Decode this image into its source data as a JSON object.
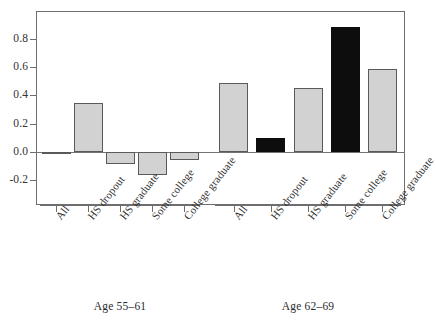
{
  "chart_data": {
    "type": "bar",
    "title": "",
    "subtitle": "",
    "xlabel": "",
    "ylabel": "",
    "ylim": [
      -0.3,
      0.98
    ],
    "grid": false,
    "legend": "none",
    "yticks": [
      {
        "value": 0.8,
        "label": "0.8"
      },
      {
        "value": 0.6,
        "label": "0.6"
      },
      {
        "value": 0.4,
        "label": "0.4"
      },
      {
        "value": 0.2,
        "label": "0.2"
      },
      {
        "value": 0.0,
        "label": "0.0"
      },
      {
        "value": -0.2,
        "label": "-0.2"
      }
    ],
    "categories": [
      "All",
      "HS dropout",
      "HS graduate",
      "Some college",
      "College graduate"
    ],
    "groups": [
      {
        "name": "Age 55-61",
        "label": "Age 55–61",
        "bars": [
          {
            "category": "All",
            "value": -0.01,
            "color": "#d2d2d2",
            "style": "light"
          },
          {
            "category": "HS dropout",
            "value": 0.345,
            "color": "#d2d2d2",
            "style": "light"
          },
          {
            "category": "HS graduate",
            "value": -0.085,
            "color": "#d2d2d2",
            "style": "light"
          },
          {
            "category": "Some college",
            "value": -0.165,
            "color": "#d2d2d2",
            "style": "light"
          },
          {
            "category": "College graduate",
            "value": -0.06,
            "color": "#d2d2d2",
            "style": "light"
          }
        ]
      },
      {
        "name": "Age 62-69",
        "label": "Age 62–69",
        "bars": [
          {
            "category": "All",
            "value": 0.485,
            "color": "#d2d2d2",
            "style": "light"
          },
          {
            "category": "HS dropout",
            "value": 0.1,
            "color": "#0d0d0d",
            "style": "dark"
          },
          {
            "category": "HS graduate",
            "value": 0.45,
            "color": "#d2d2d2",
            "style": "light"
          },
          {
            "category": "Some college",
            "value": 0.885,
            "color": "#0d0d0d",
            "style": "dark"
          },
          {
            "category": "College graduate",
            "value": 0.585,
            "color": "#d2d2d2",
            "style": "light"
          }
        ]
      }
    ],
    "colors": {
      "light_bar": "#d2d2d2",
      "dark_bar": "#0d0d0d",
      "bar_edge": "#5a5a5a",
      "axis": "#6e6e6e",
      "text": "#333333",
      "background": "#ffffff"
    }
  }
}
